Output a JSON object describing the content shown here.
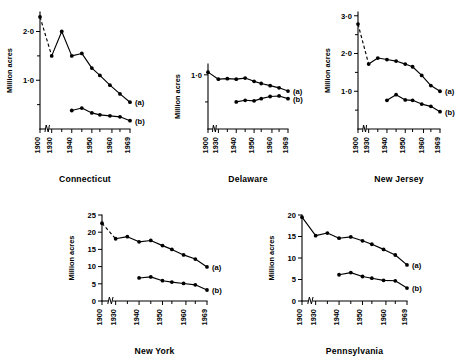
{
  "figure": {
    "ylabel": "Million acres",
    "series_labels": {
      "a": "(a)",
      "b": "(b)"
    },
    "xtick_labels": [
      "1900",
      "1930",
      "1940",
      "1950",
      "1960",
      "1969"
    ],
    "axis_break": true,
    "marker": "filled-circle",
    "line_color": "#000000"
  },
  "chart_data": [
    {
      "type": "line",
      "title": "Connecticut",
      "xlabel": "",
      "ylabel": "Million acres",
      "grid": false,
      "legend_position": "right-inline",
      "xlim": [
        1900,
        1969
      ],
      "ylim": [
        0,
        2.4
      ],
      "yticks": [
        1.0,
        2.0
      ],
      "ytick_labels": [
        "1·0",
        "2·0"
      ],
      "xticks": [
        1900,
        1930,
        1940,
        1950,
        1960,
        1969
      ],
      "xtick_labels": [
        "1900",
        "1930",
        "1940",
        "1950",
        "1960",
        "1969"
      ],
      "series": [
        {
          "name": "(a)",
          "style": "solid-with-leading-dash",
          "x": [
            1900,
            1930,
            1935,
            1940,
            1945,
            1950,
            1954,
            1959,
            1964,
            1969
          ],
          "values": [
            2.3,
            1.5,
            2.0,
            1.5,
            1.55,
            1.25,
            1.1,
            0.9,
            0.72,
            0.55
          ]
        },
        {
          "name": "(b)",
          "style": "solid",
          "x": [
            1940,
            1945,
            1950,
            1954,
            1959,
            1964,
            1969
          ],
          "values": [
            0.38,
            0.43,
            0.33,
            0.29,
            0.27,
            0.25,
            0.17
          ]
        }
      ]
    },
    {
      "type": "line",
      "title": "Delaware",
      "xlabel": "",
      "ylabel": "Million acres",
      "grid": false,
      "legend_position": "right-inline",
      "xlim": [
        1900,
        1969
      ],
      "ylim": [
        0,
        1.2
      ],
      "yticks": [
        1.0
      ],
      "ytick_labels": [
        "1·0"
      ],
      "xticks": [
        1900,
        1930,
        1940,
        1950,
        1960,
        1969
      ],
      "xtick_labels": [
        "1900",
        "1930",
        "1940",
        "1950",
        "1960",
        "1969"
      ],
      "series": [
        {
          "name": "(a)",
          "style": "solid",
          "x": [
            1900,
            1930,
            1935,
            1940,
            1945,
            1950,
            1954,
            1959,
            1964,
            1969
          ],
          "values": [
            1.05,
            0.92,
            0.93,
            0.92,
            0.94,
            0.88,
            0.84,
            0.8,
            0.76,
            0.7
          ]
        },
        {
          "name": "(b)",
          "style": "solid",
          "x": [
            1940,
            1945,
            1950,
            1954,
            1959,
            1964,
            1969
          ],
          "values": [
            0.5,
            0.53,
            0.52,
            0.56,
            0.6,
            0.61,
            0.56
          ]
        }
      ]
    },
    {
      "type": "line",
      "title": "New Jersey",
      "xlabel": "",
      "ylabel": "Million acres",
      "grid": false,
      "legend_position": "right-inline",
      "xlim": [
        1900,
        1969
      ],
      "ylim": [
        0,
        3.1
      ],
      "yticks": [
        1.0,
        2.0,
        3.0
      ],
      "ytick_labels": [
        "1·0",
        "2·0",
        "3·0"
      ],
      "xticks": [
        1900,
        1930,
        1940,
        1950,
        1960,
        1969
      ],
      "xtick_labels": [
        "1900",
        "1930",
        "1940",
        "1950",
        "1960",
        "1969"
      ],
      "series": [
        {
          "name": "(a)",
          "style": "solid-with-leading-dash",
          "x": [
            1900,
            1930,
            1935,
            1940,
            1945,
            1950,
            1954,
            1959,
            1964,
            1969
          ],
          "values": [
            2.78,
            1.72,
            1.88,
            1.84,
            1.8,
            1.72,
            1.65,
            1.42,
            1.15,
            1.0
          ]
        },
        {
          "name": "(b)",
          "style": "solid",
          "x": [
            1940,
            1945,
            1950,
            1954,
            1959,
            1964,
            1969
          ],
          "values": [
            0.76,
            0.91,
            0.77,
            0.76,
            0.66,
            0.6,
            0.46
          ]
        }
      ]
    },
    {
      "type": "line",
      "title": "New York",
      "xlabel": "",
      "ylabel": "Million acres",
      "grid": false,
      "legend_position": "right-inline",
      "xlim": [
        1900,
        1969
      ],
      "ylim": [
        0,
        25
      ],
      "yticks": [
        0,
        5,
        10,
        15,
        20,
        25
      ],
      "ytick_labels": [
        "0",
        "5",
        "10",
        "15",
        "20",
        "25"
      ],
      "xticks": [
        1900,
        1930,
        1940,
        1950,
        1960,
        1969
      ],
      "xtick_labels": [
        "1900",
        "1930",
        "1940",
        "1950",
        "1960",
        "1969"
      ],
      "series": [
        {
          "name": "(a)",
          "style": "solid-with-leading-dash",
          "x": [
            1900,
            1930,
            1935,
            1940,
            1945,
            1950,
            1954,
            1959,
            1964,
            1969
          ],
          "values": [
            22.6,
            18.1,
            18.7,
            17.2,
            17.6,
            16.1,
            15.0,
            13.4,
            12.2,
            9.9
          ]
        },
        {
          "name": "(b)",
          "style": "solid",
          "x": [
            1940,
            1945,
            1950,
            1954,
            1959,
            1964,
            1969
          ],
          "values": [
            6.7,
            7.0,
            5.9,
            5.5,
            5.1,
            4.7,
            3.2
          ]
        }
      ]
    },
    {
      "type": "line",
      "title": "Pennsylvania",
      "xlabel": "",
      "ylabel": "Million acres",
      "grid": false,
      "legend_position": "right-inline",
      "xlim": [
        1900,
        1969
      ],
      "ylim": [
        0,
        20
      ],
      "yticks": [
        0,
        5,
        10,
        15,
        20
      ],
      "ytick_labels": [
        "0",
        "5",
        "10",
        "15",
        "20"
      ],
      "xticks": [
        1900,
        1930,
        1940,
        1950,
        1960,
        1969
      ],
      "xtick_labels": [
        "1900",
        "1930",
        "1940",
        "1950",
        "1960",
        "1969"
      ],
      "series": [
        {
          "name": "(a)",
          "style": "solid",
          "x": [
            1900,
            1930,
            1935,
            1940,
            1945,
            1950,
            1954,
            1959,
            1964,
            1969
          ],
          "values": [
            19.5,
            15.2,
            15.8,
            14.6,
            14.9,
            14.0,
            13.2,
            12.0,
            10.7,
            8.4
          ]
        },
        {
          "name": "(b)",
          "style": "solid",
          "x": [
            1940,
            1945,
            1950,
            1954,
            1959,
            1964,
            1969
          ],
          "values": [
            6.1,
            6.6,
            5.7,
            5.3,
            4.8,
            4.7,
            3.0
          ]
        }
      ]
    }
  ]
}
